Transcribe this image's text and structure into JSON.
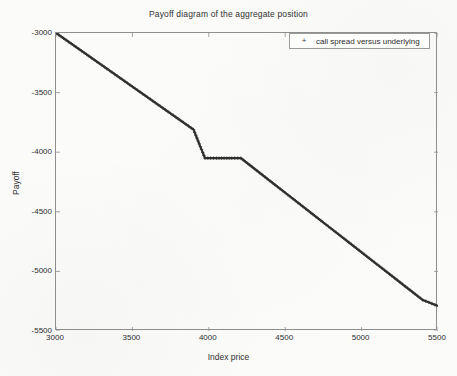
{
  "chart_data": {
    "type": "line",
    "title": "Payoff diagram of the aggregate position",
    "xlabel": "Index price",
    "ylabel": "Payoff",
    "xlim": [
      3000,
      5500
    ],
    "ylim": [
      -5500,
      -3000
    ],
    "xticks": [
      3000,
      3500,
      4000,
      4500,
      5000,
      5500
    ],
    "yticks": [
      -3000,
      -3500,
      -4000,
      -4500,
      -5000,
      -5500
    ],
    "xtick_labels": [
      "3000",
      "3500",
      "4000",
      "4500",
      "5000",
      "5500"
    ],
    "ytick_labels": [
      "-3000",
      "-3500",
      "-4000",
      "-4500",
      "-5000",
      "-5500"
    ],
    "grid": false,
    "legend_position": "top-right",
    "marker": "+",
    "series": [
      {
        "name": "call spread versus underlying",
        "marker": "+",
        "color": "#303030",
        "x": [
          3000,
          3100,
          3200,
          3300,
          3400,
          3500,
          3600,
          3700,
          3800,
          3900,
          3975,
          4050,
          4100,
          4150,
          4210,
          4300,
          4400,
          4500,
          4600,
          4700,
          4800,
          4900,
          5000,
          5100,
          5200,
          5300,
          5400,
          5500
        ],
        "y": [
          -3000,
          -3090,
          -3180,
          -3270,
          -3360,
          -3450,
          -3540,
          -3630,
          -3720,
          -3810,
          -4050,
          -4050,
          -4050,
          -4050,
          -4050,
          -4140,
          -4240,
          -4340,
          -4440,
          -4540,
          -4640,
          -4740,
          -4840,
          -4940,
          -5040,
          -5140,
          -5240,
          -5290
        ],
        "annotations": [
          {
            "label": "plateau",
            "x_start": 3975,
            "x_end": 4210,
            "y": -4050
          }
        ]
      }
    ]
  },
  "legend": {
    "marker": "+",
    "entries": [
      {
        "label": "call spread versus underlying"
      }
    ]
  }
}
